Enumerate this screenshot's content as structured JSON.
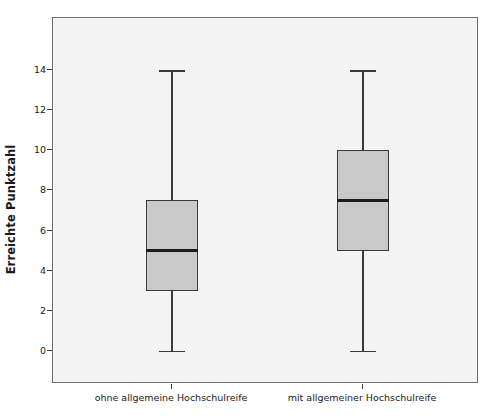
{
  "chart_data": {
    "type": "box",
    "title": "",
    "xlabel": "",
    "ylabel": "Erreichte Punktzahl",
    "ylim": [
      -1.65,
      16.6
    ],
    "yticks": [
      0,
      2,
      4,
      6,
      8,
      10,
      12,
      14
    ],
    "ytick_labels": [
      "0",
      "2",
      "4",
      "6",
      "8",
      "10",
      "12",
      "14"
    ],
    "grid": false,
    "legend": "none",
    "categories": [
      "ohne allgemeine Hochschulreife",
      "mit allgemeiner Hochschulreife"
    ],
    "boxes": [
      {
        "category": "ohne allgemeine Hochschulreife",
        "whisker_low": 0,
        "q1": 3,
        "median": 5,
        "q3": 7.5,
        "whisker_high": 14,
        "outliers": []
      },
      {
        "category": "mit allgemeiner Hochschulreife",
        "whisker_low": 0,
        "q1": 5,
        "median": 7.5,
        "q3": 10,
        "whisker_high": 14,
        "outliers": []
      }
    ],
    "colors": {
      "box_fill": "#c9c9c9",
      "box_edge": "#3a3a3a",
      "median_line": "#1c1c1c",
      "plot_background": "#f4f4f4",
      "plot_border": "#6d6d6d",
      "figure_background": "#ffffff",
      "text": "#222222"
    }
  },
  "axis": {
    "y_title": "Erreichte Punktzahl",
    "y_ticks": [
      {
        "label": "14"
      },
      {
        "label": "12"
      },
      {
        "label": "10"
      },
      {
        "label": "8"
      },
      {
        "label": "6"
      },
      {
        "label": "4"
      },
      {
        "label": "2"
      },
      {
        "label": "0"
      }
    ],
    "x_ticks": [
      {
        "label": "ohne allgemeine Hochschulreife"
      },
      {
        "label": "mit allgemeiner Hochschulreife"
      }
    ]
  }
}
